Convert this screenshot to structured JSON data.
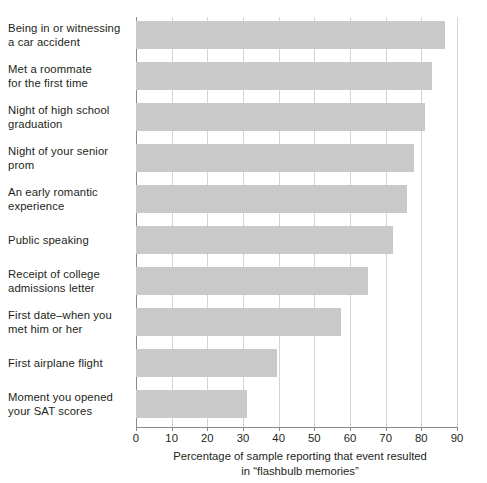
{
  "chart_data": {
    "type": "bar",
    "orientation": "horizontal",
    "title": "",
    "subtitle": "",
    "xlabel_lines": [
      "Percentage of sample reporting that event resulted",
      "in “flashbulb memories”"
    ],
    "ylabel": "",
    "categories": [
      "Being in or witnessing a car accident",
      "Met a roommate for the first time",
      "Night of high school graduation",
      "Night of your senior prom",
      "An early romantic experience",
      "Public speaking",
      "Receipt of college admissions letter",
      "First date–when you met him or her",
      "First airplane flight",
      "Moment you opened your SAT scores"
    ],
    "category_label_lines": [
      [
        "Being in or witnessing",
        "a car accident"
      ],
      [
        "Met a roommate",
        "for the first time"
      ],
      [
        "Night of high school",
        "graduation"
      ],
      [
        "Night of your senior",
        "prom"
      ],
      [
        "An early romantic",
        "experience"
      ],
      [
        "Public speaking"
      ],
      [
        "Receipt of college",
        "admissions letter"
      ],
      [
        "First date–when you",
        "met him or her"
      ],
      [
        "First airplane flight"
      ],
      [
        "Moment you opened",
        "your SAT scores"
      ]
    ],
    "values": [
      86.5,
      83,
      81,
      78,
      76,
      72,
      65,
      57.5,
      39.5,
      31
    ],
    "xlim": [
      0,
      90
    ],
    "xticks": [
      0,
      10,
      20,
      30,
      40,
      50,
      60,
      70,
      80,
      90
    ],
    "xtick_labels": [
      "0",
      "10",
      "20",
      "30",
      "40",
      "50",
      "60",
      "70",
      "80",
      "90"
    ],
    "grid": "vertical",
    "legend": null,
    "bar_color": "#c9c9c9",
    "axis_color": "#8a8a8a",
    "gridline_color": "#d4d4d4",
    "text_color": "#231f20",
    "background_color": "#ffffff"
  }
}
